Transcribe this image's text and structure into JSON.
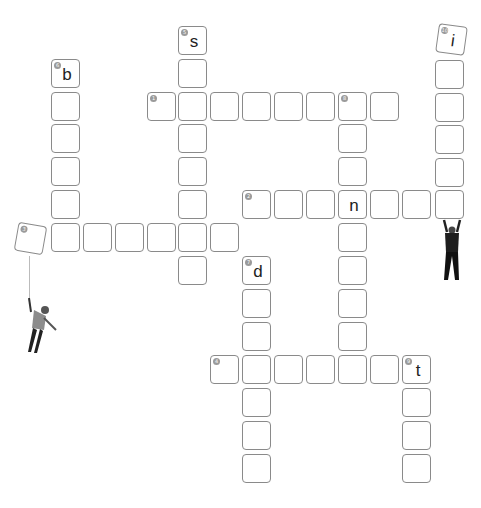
{
  "puzzle": {
    "type": "crossword",
    "colors": {
      "border": "#8a8a8a",
      "number_badge": "#9a9a9a",
      "letter": "#222222",
      "background": "#ffffff"
    },
    "cells": [
      {
        "x": 178,
        "y": 26,
        "num": "5",
        "letter": "s"
      },
      {
        "x": 178,
        "y": 59
      },
      {
        "x": 147,
        "y": 92,
        "num": "1"
      },
      {
        "x": 178,
        "y": 92
      },
      {
        "x": 210,
        "y": 92
      },
      {
        "x": 242,
        "y": 92
      },
      {
        "x": 274,
        "y": 92
      },
      {
        "x": 306,
        "y": 92
      },
      {
        "x": 338,
        "y": 92,
        "num": "8"
      },
      {
        "x": 370,
        "y": 92
      },
      {
        "x": 51,
        "y": 59,
        "num": "6",
        "letter": "b"
      },
      {
        "x": 51,
        "y": 92
      },
      {
        "x": 51,
        "y": 124
      },
      {
        "x": 51,
        "y": 157
      },
      {
        "x": 51,
        "y": 190
      },
      {
        "x": 178,
        "y": 124
      },
      {
        "x": 178,
        "y": 157
      },
      {
        "x": 178,
        "y": 190
      },
      {
        "x": 338,
        "y": 124
      },
      {
        "x": 338,
        "y": 157
      },
      {
        "x": 435,
        "y": 60
      },
      {
        "x": 435,
        "y": 93
      },
      {
        "x": 435,
        "y": 125
      },
      {
        "x": 435,
        "y": 158
      },
      {
        "x": 242,
        "y": 190,
        "num": "2"
      },
      {
        "x": 274,
        "y": 190
      },
      {
        "x": 306,
        "y": 190
      },
      {
        "x": 338,
        "y": 190,
        "letter": "n"
      },
      {
        "x": 370,
        "y": 190
      },
      {
        "x": 402,
        "y": 190
      },
      {
        "x": 435,
        "y": 190
      },
      {
        "x": 51,
        "y": 223
      },
      {
        "x": 83,
        "y": 223
      },
      {
        "x": 115,
        "y": 223
      },
      {
        "x": 147,
        "y": 223
      },
      {
        "x": 178,
        "y": 223
      },
      {
        "x": 210,
        "y": 223
      },
      {
        "x": 338,
        "y": 223
      },
      {
        "x": 178,
        "y": 256
      },
      {
        "x": 338,
        "y": 256
      },
      {
        "x": 242,
        "y": 256,
        "num": "7",
        "letter": "d"
      },
      {
        "x": 242,
        "y": 289
      },
      {
        "x": 338,
        "y": 289
      },
      {
        "x": 242,
        "y": 322
      },
      {
        "x": 338,
        "y": 322
      },
      {
        "x": 210,
        "y": 355,
        "num": "4"
      },
      {
        "x": 242,
        "y": 355
      },
      {
        "x": 274,
        "y": 355
      },
      {
        "x": 306,
        "y": 355
      },
      {
        "x": 338,
        "y": 355
      },
      {
        "x": 370,
        "y": 355
      },
      {
        "x": 402,
        "y": 355,
        "num": "9",
        "letter": "t"
      },
      {
        "x": 242,
        "y": 388
      },
      {
        "x": 242,
        "y": 421
      },
      {
        "x": 242,
        "y": 454
      },
      {
        "x": 402,
        "y": 388
      },
      {
        "x": 402,
        "y": 421
      },
      {
        "x": 402,
        "y": 454
      }
    ],
    "tilted_cells": [
      {
        "id": "clue-10",
        "x": 437,
        "y": 25,
        "num": "10",
        "letter": "i",
        "rotate": 8
      },
      {
        "id": "clue-3",
        "x": 16,
        "y": 224,
        "num": "3",
        "letter": "",
        "rotate": 10
      }
    ],
    "figures": [
      {
        "name": "hanging-person-figure",
        "x": 18,
        "y": 300
      },
      {
        "name": "lifting-person-figure",
        "x": 440,
        "y": 218
      }
    ]
  }
}
